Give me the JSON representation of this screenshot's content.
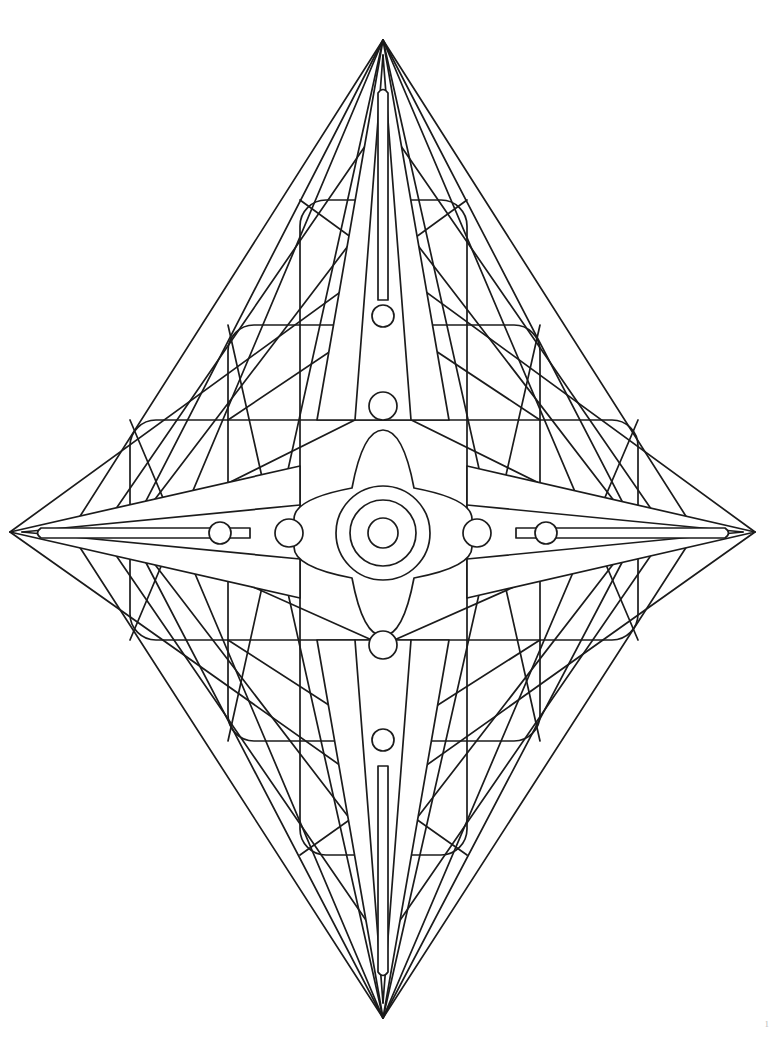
{
  "document": {
    "type": "coloring-book-page",
    "title": "Geometric Star Mandala",
    "page_number": "1",
    "background_color": "#ffffff",
    "line_color": "#1b1b1b"
  },
  "artwork": {
    "name": "four-pointed-star-mandala",
    "description": "Symmetric four-pointed star mandala built from nested rounded squares, crossing diagonal rays, spike points and concentric circles",
    "center": {
      "x": 383,
      "y": 533
    },
    "symmetry": "4-fold (vertical and horizontal mirror)",
    "spikes": [
      {
        "name": "top-spike",
        "tip_x": 383,
        "tip_y": 40,
        "base_half_width": 66
      },
      {
        "name": "bottom-spike",
        "tip_x": 383,
        "tip_y": 1018,
        "base_half_width": 66
      },
      {
        "name": "left-spike",
        "tip_x": 10,
        "tip_y": 532,
        "base_half_width": 66
      },
      {
        "name": "right-spike",
        "tip_x": 755,
        "tip_y": 532,
        "base_half_width": 66
      }
    ],
    "needles": [
      {
        "name": "top-needle",
        "tip_y": 88,
        "base_y": 300,
        "half_width": 5
      },
      {
        "name": "bottom-needle",
        "tip_y": 977,
        "base_y": 766,
        "half_width": 5
      },
      {
        "name": "left-needle",
        "tip_x": 34,
        "base_x": 250,
        "half_width": 5
      },
      {
        "name": "right-needle",
        "tip_x": 732,
        "base_x": 516,
        "half_width": 5
      }
    ],
    "rounded_squares": [
      {
        "name": "outer-rounded-square",
        "x": 130,
        "y": 420,
        "width": 508,
        "height": 220,
        "radius": 26
      },
      {
        "name": "middle-rounded-square",
        "x": 228,
        "y": 325,
        "width": 312,
        "height": 416,
        "radius": 26
      },
      {
        "name": "inner-rounded-square",
        "x": 300,
        "y": 200,
        "width": 167,
        "height": 655,
        "radius": 26
      }
    ],
    "center_circles": [
      {
        "name": "center-circle-outer",
        "cx": 383,
        "cy": 533,
        "r": 47
      },
      {
        "name": "center-circle-middle",
        "cx": 383,
        "cy": 533,
        "r": 33
      },
      {
        "name": "center-circle-inner",
        "cx": 383,
        "cy": 533,
        "r": 15
      }
    ],
    "axis_dots": [
      {
        "name": "dot-left-outer",
        "cx": 220,
        "cy": 533,
        "r": 11
      },
      {
        "name": "dot-left-inner",
        "cx": 289,
        "cy": 533,
        "r": 14
      },
      {
        "name": "dot-right-inner",
        "cx": 477,
        "cy": 533,
        "r": 14
      },
      {
        "name": "dot-right-outer",
        "cx": 546,
        "cy": 533,
        "r": 11
      },
      {
        "name": "dot-top-outer",
        "cx": 383,
        "cy": 316,
        "r": 11
      },
      {
        "name": "dot-top-inner",
        "cx": 383,
        "cy": 406,
        "r": 14
      },
      {
        "name": "dot-bottom-inner",
        "cx": 383,
        "cy": 645,
        "r": 14
      },
      {
        "name": "dot-bottom-outer",
        "cx": 383,
        "cy": 740,
        "r": 11
      }
    ],
    "lattice": {
      "name": "diagonal-ray-lattice",
      "ray_count": 16,
      "description": "Straight rays from each spike tip region to the opposite corners forming a diamond web"
    }
  }
}
